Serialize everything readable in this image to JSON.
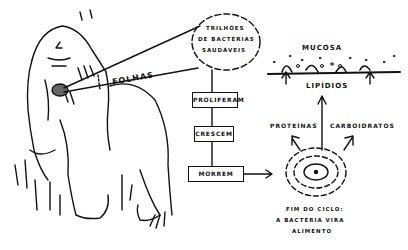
{
  "diagram": {
    "labels": {
      "leaves": "FOLHAS",
      "bubble_line1": "TRILHÕES",
      "bubble_line2": "DE BACTÉRIAS",
      "bubble_line3": "SAUDÁVEIS",
      "mucosa": "MUCOSA",
      "lipids": "LIPÍDIOS",
      "proteins": "PROTEÍNAS",
      "carbs": "CARBOIDRATOS",
      "end_line1": "FIM DO CICLO:",
      "end_line2": "A BACTÉRIA VIRA",
      "end_line3": "ALIMENTO"
    },
    "flow": [
      {
        "label": "PROLIFERAM"
      },
      {
        "label": "CRESCEM"
      },
      {
        "label": "MORREM"
      }
    ],
    "colors": {
      "ink": "#111111",
      "background": "#ffffff"
    }
  }
}
